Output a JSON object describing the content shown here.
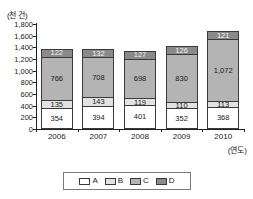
{
  "chart_data": {
    "type": "bar",
    "subtype": "stacked",
    "title": "",
    "xlabel": "(연도)",
    "ylabel": "(천 건)",
    "categories": [
      "2006",
      "2007",
      "2008",
      "2009",
      "2010"
    ],
    "series": [
      {
        "name": "A",
        "color": "#ffffff",
        "values": [
          354,
          394,
          401,
          352,
          368
        ],
        "labels": [
          "354",
          "394",
          "401",
          "352",
          "368"
        ]
      },
      {
        "name": "B",
        "color": "#e2e2e2",
        "values": [
          135,
          143,
          119,
          110,
          113
        ],
        "labels": [
          "135",
          "143",
          "119",
          "110",
          "113"
        ]
      },
      {
        "name": "C",
        "color": "#b4b4b4",
        "values": [
          766,
          708,
          698,
          830,
          1072
        ],
        "labels": [
          "766",
          "708",
          "698",
          "830",
          "1,072"
        ]
      },
      {
        "name": "D",
        "color": "#8a8a8a",
        "values": [
          122,
          132,
          127,
          126,
          121
        ],
        "labels": [
          "122",
          "132",
          "127",
          "126",
          "121"
        ]
      }
    ],
    "totals": [
      1377,
      1377,
      1345,
      1418,
      1674
    ],
    "ylim": [
      0,
      1800
    ],
    "ytick_step": 200,
    "ytick_labels": [
      "0",
      "200",
      "400",
      "600",
      "800",
      "1,000",
      "1,200",
      "1,400",
      "1,600",
      "1,800"
    ],
    "ytick_values": [
      0,
      200,
      400,
      600,
      800,
      1000,
      1200,
      1400,
      1600,
      1800
    ],
    "grid": false,
    "legend_position": "bottom",
    "legend_entries": [
      "A",
      "B",
      "C",
      "D"
    ]
  }
}
